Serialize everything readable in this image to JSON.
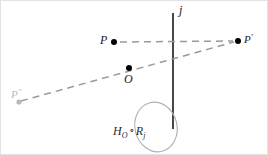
{
  "figure": {
    "width": 268,
    "height": 155,
    "background": "#ffffff"
  },
  "colors": {
    "line_solid": "#1a1a1a",
    "dashed": "#9a9a9a",
    "point_fill": "#000000",
    "point_faded": "#b9b9b9",
    "oval_stroke": "#b0b0b0",
    "label_text": "#1a1a1a",
    "label_faded": "#b9b9b9",
    "border": "#e3e3e3"
  },
  "labels": {
    "point_P": "P",
    "point_P_prime": "P",
    "point_P_prime_mark": "′",
    "point_P_double_prime": "P",
    "point_P_double_prime_mark": "″",
    "point_O": "O",
    "line_j": "j",
    "formula_H": "H",
    "formula_H_sub": "O",
    "formula_compose": "∘",
    "formula_R": "R",
    "formula_R_sub": "j"
  },
  "geometry": {
    "mirror_line_j": {
      "x": 172,
      "y1": 12,
      "y2": 128
    },
    "points": [
      {
        "name": "P",
        "x": 113,
        "y": 41,
        "r": 3.0,
        "color": "#000000"
      },
      {
        "name": "P'",
        "x": 237,
        "y": 40,
        "r": 3.0,
        "color": "#000000"
      },
      {
        "name": "O",
        "x": 128,
        "y": 67,
        "r": 3.0,
        "color": "#000000"
      },
      {
        "name": "P''",
        "x": 18,
        "y": 101,
        "r": 2.6,
        "color": "#b9b9b9"
      }
    ],
    "dashed_segments": [
      {
        "name": "P-to-Pprime",
        "x1": 119,
        "y1": 41,
        "x2": 233,
        "y2": 40
      },
      {
        "name": "Pdoubleprime-to-Pprime",
        "x1": 20,
        "y1": 100,
        "x2": 234,
        "y2": 41
      }
    ],
    "annotation_oval": {
      "cx": 155,
      "cy": 126,
      "rx": 21,
      "ry": 25,
      "rotate": -14
    }
  }
}
